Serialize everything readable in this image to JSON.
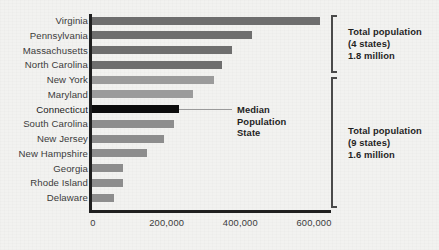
{
  "chart_data": {
    "type": "bar",
    "orientation": "horizontal",
    "title": "",
    "subtitle": "",
    "xlabel": "",
    "ylabel": "",
    "xlim": [
      0,
      660000
    ],
    "grid": false,
    "legend": null,
    "tick_labels": [
      "0",
      "200,000",
      "400,000",
      "600,000"
    ],
    "tick_values": [
      0,
      200000,
      400000,
      600000
    ],
    "categories": [
      "Virginia",
      "Pennsylvania",
      "Massachusetts",
      "North Carolina",
      "New York",
      "Maryland",
      "Connecticut",
      "South Carolina",
      "New Jersey",
      "New Hampshire",
      "Georgia",
      "Rhode Island",
      "Delaware"
    ],
    "values": [
      620000,
      434000,
      379000,
      354000,
      331000,
      275000,
      237000,
      222000,
      195000,
      150000,
      83000,
      83000,
      60000
    ],
    "bar_colors": [
      "#6e6e6e",
      "#6e6e6e",
      "#6e6e6e",
      "#6e6e6e",
      "#9b9b9b",
      "#9b9b9b",
      "#0d0d0d",
      "#8d8d8d",
      "#8d8d8d",
      "#8d8d8d",
      "#8d8d8d",
      "#8d8d8d",
      "#8d8d8d"
    ],
    "annotations": [
      {
        "name": "median-callout",
        "lines": [
          "Median",
          "Population",
          "State"
        ],
        "points_to": "Connecticut"
      },
      {
        "name": "group-top",
        "lines": [
          "Total population",
          "(4 states)",
          "1.8 million"
        ],
        "covers": [
          "Virginia",
          "Pennsylvania",
          "Massachusetts",
          "North Carolina"
        ]
      },
      {
        "name": "group-bottom",
        "lines": [
          "Total population",
          "(9 states)",
          "1.6 million"
        ],
        "covers": [
          "New York",
          "Maryland",
          "Connecticut",
          "South Carolina",
          "New Jersey",
          "New Hampshire",
          "Georgia",
          "Rhode Island",
          "Delaware"
        ]
      }
    ]
  },
  "median_callout": {
    "line1": "Median",
    "line2": "Population",
    "line3": "State"
  },
  "group_top": {
    "line1": "Total population",
    "line2": "(4 states)",
    "line3": "1.8 million"
  },
  "group_bottom": {
    "line1": "Total population",
    "line2": "(9 states)",
    "line3": "1.6 million"
  },
  "colors": {
    "background": "#f2f2f0",
    "axis": "#1f1f1f",
    "bar_dark": "#6e6e6e",
    "bar_light": "#9b9b9b",
    "bar_mid": "#8d8d8d",
    "bar_highlight": "#0d0d0d",
    "text": "#3b3b3b",
    "bracket": "#4a4a4a"
  }
}
